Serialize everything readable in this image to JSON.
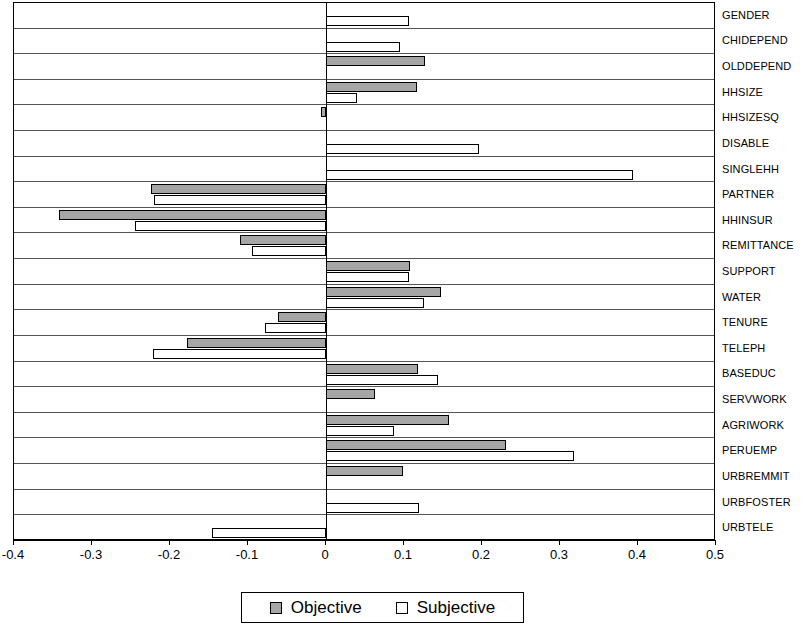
{
  "chart_data": {
    "type": "bar",
    "orientation": "horizontal",
    "title": "",
    "xlabel": "",
    "ylabel": "",
    "xlim": [
      -0.4,
      0.5
    ],
    "xticks": [
      "-0.4",
      "-0.3",
      "-0.2",
      "-0.1",
      "0",
      "0.1",
      "0.2",
      "0.3",
      "0.4",
      "0.5"
    ],
    "xtick_values": [
      -0.4,
      -0.3,
      -0.2,
      -0.1,
      0,
      0.1,
      0.2,
      0.3,
      0.4,
      0.5
    ],
    "grid": "horizontal-row-separators",
    "legend_position": "bottom-center",
    "categories": [
      "GENDER",
      "CHIDEPEND",
      "OLDDEPEND",
      "HHSIZE",
      "HHSIZESQ",
      "DISABLE",
      "SINGLEHH",
      "PARTNER",
      "HHINSUR",
      "REMITTANCE",
      "SUPPORT",
      "WATER",
      "TENURE",
      "TELEPH",
      "BASEDUC",
      "SERVWORK",
      "AGRIWORK",
      "PERUEMP",
      "URBREMMIT",
      "URBFOSTER",
      "URBTELE"
    ],
    "series": [
      {
        "name": "Objective",
        "color": "#a6a6a6",
        "values": [
          null,
          null,
          0.127,
          0.117,
          -0.006,
          null,
          null,
          -0.225,
          -0.342,
          -0.11,
          0.108,
          0.148,
          -0.062,
          -0.178,
          0.118,
          0.063,
          0.158,
          0.231,
          0.099,
          null,
          null
        ]
      },
      {
        "name": "Subjective",
        "color": "#ffffff",
        "values": [
          0.106,
          0.095,
          null,
          0.04,
          null,
          0.196,
          0.394,
          -0.22,
          -0.245,
          -0.095,
          0.106,
          0.125,
          -0.078,
          -0.222,
          0.143,
          null,
          0.087,
          0.318,
          null,
          0.119,
          -0.146
        ]
      }
    ]
  },
  "legend": {
    "items": [
      {
        "label": "Objective",
        "swatch": "objective"
      },
      {
        "label": "Subjective",
        "swatch": "subjective"
      }
    ]
  }
}
